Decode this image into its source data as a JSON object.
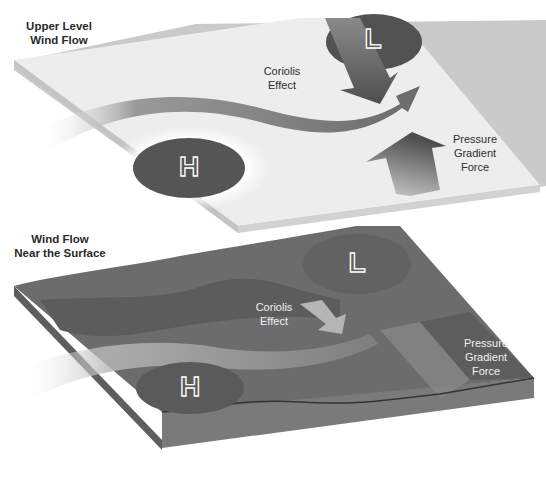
{
  "upper_panel": {
    "title_line1": "Upper Level",
    "title_line2": "Wind Flow",
    "low_symbol": "L",
    "high_symbol": "H",
    "coriolis_line1": "Coriolis",
    "coriolis_line2": "Effect",
    "pgf_line1": "Pressure",
    "pgf_line2": "Gradient",
    "pgf_line3": "Force"
  },
  "lower_panel": {
    "title_line1": "Wind Flow",
    "title_line2": "Near the Surface",
    "low_symbol": "L",
    "high_symbol": "H",
    "coriolis_line1": "Coriolis",
    "coriolis_line2": "Effect",
    "pgf_line1": "Pressure",
    "pgf_line2": "Gradient",
    "pgf_line3": "Force"
  },
  "colors": {
    "upper_plate": "#ececec",
    "upper_plate_edge": "#c9c9c9",
    "pressure_ellipse": "#5a5a5a",
    "arrow_dark": "#5c5c5c",
    "ground": "#6b6b6b",
    "ground_dark": "#555555",
    "flow_band_light": "#a9a9a9"
  }
}
